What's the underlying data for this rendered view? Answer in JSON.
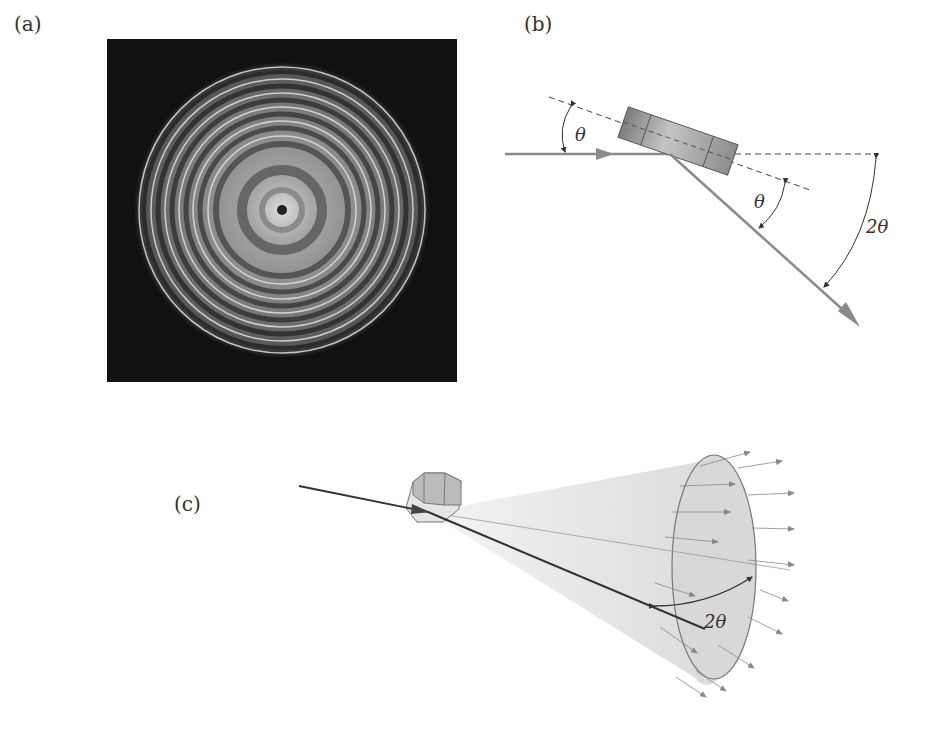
{
  "figure": {
    "panels": [
      {
        "id": "a",
        "label": "(a)",
        "description": "Concentric diffraction ring pattern on dark background"
      },
      {
        "id": "b",
        "label": "(b)",
        "description": "Bragg reflection from tilted crystal plane",
        "annotations": {
          "angle_incident": "θ",
          "angle_reflected": "θ",
          "angle_total": "2θ"
        }
      },
      {
        "id": "c",
        "label": "(c)",
        "description": "Diffraction cone from crystallite",
        "annotations": {
          "cone_angle": "2θ"
        }
      }
    ],
    "colors": {
      "background": "#ffffff",
      "ring_background": "#111111",
      "beam_gray": "#8a8a8a",
      "dark_beam": "#333333",
      "crystal_fill": "#9a9a9a",
      "cone_fill": "#d8d8d8"
    }
  }
}
